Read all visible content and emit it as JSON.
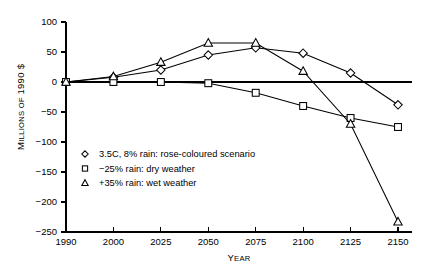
{
  "chart_data": {
    "type": "line",
    "title": "",
    "xlabel": "YEAR",
    "ylabel": "MILLIONS OF 1990 $",
    "categories": [
      "1990",
      "2000",
      "2025",
      "2050",
      "2075",
      "2100",
      "2125",
      "2150"
    ],
    "ylim": [
      -250,
      100
    ],
    "yticks": [
      100,
      50,
      0,
      -50,
      -100,
      -150,
      -200,
      -250
    ],
    "ytick_labels": [
      "100",
      "50",
      "0",
      "−50",
      "−100",
      "−150",
      "−200",
      "−250"
    ],
    "grid": false,
    "zero_line": true,
    "legend_position": "inside-lower-left",
    "series": [
      {
        "name": "3.5C, 8% rain: rose-coloured scenario",
        "marker": "diamond",
        "values": [
          0,
          8,
          20,
          45,
          57,
          48,
          15,
          -38
        ]
      },
      {
        "name": "−25% rain: dry weather",
        "marker": "square",
        "values": [
          0,
          0,
          0,
          -2,
          -18,
          -40,
          -60,
          -75
        ]
      },
      {
        "name": "+35% rain: wet weather",
        "marker": "triangle",
        "values": [
          0,
          9,
          33,
          65,
          65,
          18,
          -70,
          -233
        ]
      }
    ]
  },
  "axis": {
    "y_label": "MILLIONS OF 1990 $",
    "y_label_head": "M",
    "y_label_rest": "ILLIONS OF ",
    "y_label_year": "1990 $",
    "x_label": "YEAR",
    "x_label_head": "Y",
    "x_label_rest": "EAR"
  },
  "legend": {
    "items": [
      {
        "marker": "diamond",
        "label": "3.5C, 8% rain: rose-coloured scenario"
      },
      {
        "marker": "square",
        "label": "−25% rain: dry weather"
      },
      {
        "marker": "triangle",
        "label": "+35% rain: wet weather"
      }
    ]
  },
  "colors": {
    "ink": "#000000",
    "paper": "#ffffff"
  }
}
